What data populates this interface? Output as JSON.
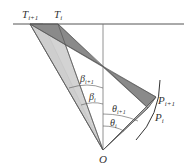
{
  "diagram": {
    "labels": {
      "T_i1": "T",
      "T_i1_sub": "i+1",
      "T_i": "T",
      "T_i_sub": "i",
      "P_i1": "P",
      "P_i1_sub": "i+1",
      "P_i": "P",
      "P_i_sub": "i",
      "beta_i1": "β",
      "beta_i1_sub": "i+1",
      "beta_i": "β",
      "beta_i_sub": "i",
      "theta_i1": "θ",
      "theta_i1_sub": "i+1",
      "theta_i": "θ",
      "theta_i_sub": "i",
      "O": "O"
    },
    "colors": {
      "light_fill": "#c8c8c8",
      "dark_fill": "#8a8a8a",
      "line": "#555555"
    }
  }
}
